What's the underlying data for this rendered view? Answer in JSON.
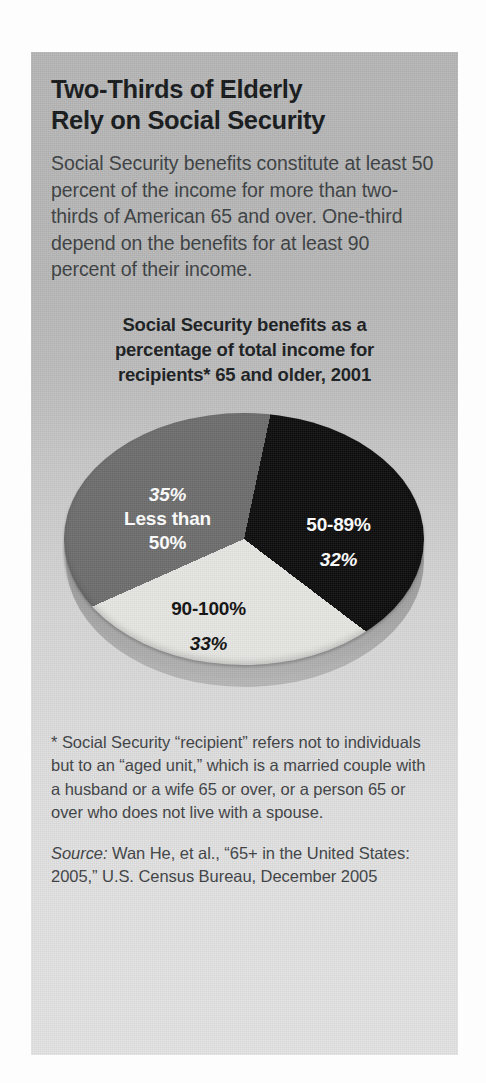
{
  "panel": {
    "headline_line1": "Two-Thirds of Elderly",
    "headline_line2": "Rely on Social Security",
    "deck": "Social Security benefits constitute at least 50 percent of the income for more than two-thirds of American 65 and over. One-third depend on the benefits for at least 90 percent of their income.",
    "chart_title_line1": "Social Security benefits as a",
    "chart_title_line2": "percentage of total income for",
    "chart_title_line3": "recipients* 65 and older, 2001",
    "footnote": "* Social Security “recipient” refers not to individuals but to an “aged unit,” which is a married couple with a husband or a wife 65 or over, or a person 65 or over who does not live with a spouse.",
    "source_word": "Source:",
    "source_text": " Wan He, et al., “65+ in the United States: 2005,” U.S. Census Bureau, December 2005"
  },
  "labels": {
    "dark_name": "50-89%",
    "dark_pct": "32%",
    "gray_pct": "35%",
    "gray_name": "Less than",
    "gray_name2": "50%",
    "light_name": "90-100%",
    "light_pct": "33%"
  },
  "colors": {
    "panel_top": "#b6b6b6",
    "panel_bottom": "#e3e3e3",
    "slice_dark": "#0d0d0d",
    "slice_gray": "#6e6e6e",
    "slice_light": "#e6e6e3",
    "text_dark": "#15181a",
    "text_body": "#3b3f42",
    "label_on_dark": "#ffffff"
  },
  "chart_data": {
    "type": "pie",
    "title": "Social Security benefits as a percentage of total income for recipients* 65 and older, 2001",
    "categories": [
      "50-89%",
      "90-100%",
      "Less than 50%"
    ],
    "values": [
      32,
      33,
      35
    ],
    "value_labels": [
      "32%",
      "33%",
      "35%"
    ],
    "slice_colors": [
      "#0d0d0d",
      "#e6e6e3",
      "#6e6e6e"
    ],
    "units": "percent of recipients",
    "legend": "none (labels drawn inside slices)",
    "start_angle_deg": 12,
    "direction": "clockwise",
    "three_d": true,
    "source": "Source: Wan He, et al., “65+ in the United States: 2005,” U.S. Census Bureau, December 2005"
  }
}
